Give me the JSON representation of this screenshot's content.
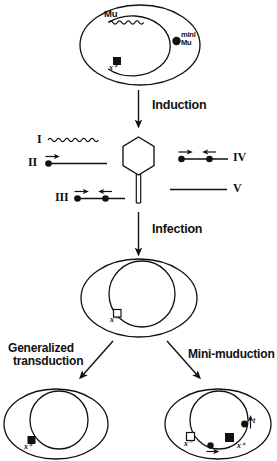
{
  "figure": {
    "stroke_color": "#111111",
    "fill_marker_color": "#000000",
    "background": "#ffffff"
  },
  "top_cell": {
    "name": "donor-cell",
    "mu_label": "Mu",
    "mini_mu_label_line1": "mini",
    "mini_mu_label_line2": "Mu",
    "marker_label": "x⁺"
  },
  "steps": {
    "induction": "Induction",
    "infection": "Infection"
  },
  "fragments": [
    {
      "numeral": "I",
      "kind": "wavy",
      "caption_side": "left"
    },
    {
      "numeral": "II",
      "kind": "one-dot-line",
      "caption_side": "left"
    },
    {
      "numeral": "III",
      "kind": "two-dot-line",
      "caption_side": "left"
    },
    {
      "numeral": "IV",
      "kind": "two-dot-line",
      "caption_side": "right"
    },
    {
      "numeral": "V",
      "kind": "plain-line",
      "caption_side": "right"
    }
  ],
  "phage": {
    "name": "phage-particle",
    "head_shape": "hexagon",
    "tail": "double-line"
  },
  "middle_cell": {
    "name": "recipient-cell",
    "marker_label": "x⁻"
  },
  "branches": {
    "left": {
      "label_line1": "Generalized",
      "label_line2": "transduction"
    },
    "right": {
      "label_line1": "Mini-muduction",
      "label_line2": ""
    }
  },
  "bottom_left_cell": {
    "name": "transductant-cell",
    "marker_label": "x⁺"
  },
  "bottom_right_cell": {
    "name": "muductant-cell",
    "marker_open_label": "x⁻",
    "marker_filled_label": "x⁺",
    "marker_extra_label": "t"
  },
  "icons": {
    "arrow_down": "down-arrow",
    "arrow_diag_left": "down-left-arrow",
    "arrow_diag_right": "down-right-arrow",
    "filled_square": "filled-square-marker",
    "open_square": "open-square-marker",
    "dot": "dot-marker",
    "small_arrow": "small-direction-arrow"
  }
}
